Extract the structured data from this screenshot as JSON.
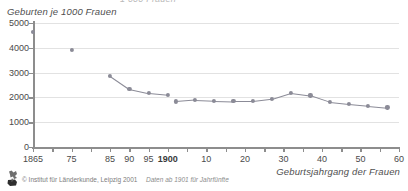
{
  "figure": {
    "clipped_title": "1 000 Frauen",
    "y_axis_title": "Geburten je 1000 Frauen",
    "x_axis_title": "Geburtsjahrgang der Frauen",
    "footnote": "Daten ab 1901 für Jahrfünfte",
    "copyright": "© Institut für Länderkunde, Leipzig 2001",
    "logo_name": "institut-fuer-laenderkunde-logo"
  },
  "colors": {
    "series": "#8b8b97",
    "grid": "#e2e2e2",
    "axis": "#8d8d8d",
    "text": "#4a4a4a",
    "background": "#ffffff"
  },
  "chart_data": {
    "type": "line",
    "title": "Geburten je 1000 Frauen",
    "xlabel": "Geburtsjahrgang der Frauen",
    "ylabel": "Geburten je 1000 Frauen",
    "xlim": [
      1865,
      1960
    ],
    "ylim": [
      0,
      5000
    ],
    "grid": true,
    "legend": "none",
    "ytick_values": [
      0,
      1000,
      2000,
      3000,
      4000,
      5000
    ],
    "ytick_labels": [
      "0",
      "1000",
      "2000",
      "3000",
      "4000",
      "5000"
    ],
    "xtick_values": [
      1865,
      1875,
      1885,
      1890,
      1895,
      1900,
      1910,
      1920,
      1930,
      1940,
      1950,
      1960
    ],
    "xtick_labels": [
      "1865",
      "75",
      "85",
      "90",
      "95",
      "1900",
      "10",
      "20",
      "30",
      "40",
      "50",
      "60"
    ],
    "xtick_bold": [
      "1900"
    ],
    "annotations": [
      "Daten ab 1901 für Jahrfünfte"
    ],
    "series": [
      {
        "name": "Einzelwerte vor 1885",
        "connected": false,
        "x": [
          1865,
          1875
        ],
        "values": [
          4650,
          3900
        ]
      },
      {
        "name": "Jahrgänge 1885-1900",
        "connected": true,
        "x": [
          1885,
          1890,
          1895,
          1900
        ],
        "values": [
          2880,
          2350,
          2180,
          2110
        ]
      },
      {
        "name": "Jahrfünfte ab 1901",
        "connected": true,
        "x": [
          1902,
          1907,
          1912,
          1917,
          1922,
          1927,
          1932,
          1937,
          1942,
          1947,
          1952,
          1957
        ],
        "values": [
          1840,
          1900,
          1870,
          1850,
          1850,
          1940,
          2180,
          2080,
          1820,
          1740,
          1670,
          1600
        ]
      }
    ]
  }
}
